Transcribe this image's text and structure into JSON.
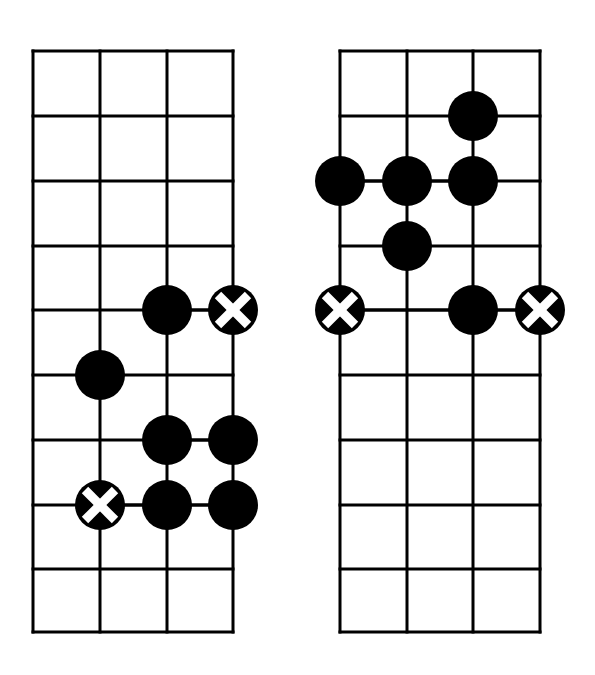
{
  "page": {
    "background_color": "#ffffff",
    "ink_color": "#000000",
    "marker_cross_color": "#ffffff",
    "width": 595,
    "height": 675
  },
  "style": {
    "grid_line_width": 3,
    "grid_outer_line_width": 3,
    "marker_radius": 25,
    "cross_arm_width": 9,
    "cross_arm_extent": 15
  },
  "diagrams": [
    {
      "id": "left-diagram",
      "name": "left-grid-diagram",
      "geometry": {
        "x_left": 33,
        "x_right": 233,
        "y_top": 51,
        "y_bottom": 632,
        "columns": 3,
        "rows": 9,
        "vertical_line_x": [
          33,
          100,
          167,
          233
        ],
        "horizontal_line_y": [
          51,
          116,
          181,
          246,
          310,
          375,
          440,
          505,
          569,
          632
        ]
      },
      "markers": [
        {
          "name": "marker-filled",
          "type": "filled",
          "x": 167,
          "y": 310,
          "string_index": 2,
          "fret_line_index": 4
        },
        {
          "name": "marker-cross",
          "type": "cross",
          "x": 233,
          "y": 310,
          "string_index": 3,
          "fret_line_index": 4
        },
        {
          "name": "marker-filled",
          "type": "filled",
          "x": 100,
          "y": 375,
          "string_index": 1,
          "fret_line_index": 5
        },
        {
          "name": "marker-filled",
          "type": "filled",
          "x": 167,
          "y": 440,
          "string_index": 2,
          "fret_line_index": 6
        },
        {
          "name": "marker-filled",
          "type": "filled",
          "x": 233,
          "y": 440,
          "string_index": 3,
          "fret_line_index": 6
        },
        {
          "name": "marker-cross",
          "type": "cross",
          "x": 100,
          "y": 505,
          "string_index": 1,
          "fret_line_index": 7
        },
        {
          "name": "marker-filled",
          "type": "filled",
          "x": 167,
          "y": 505,
          "string_index": 2,
          "fret_line_index": 7
        },
        {
          "name": "marker-filled",
          "type": "filled",
          "x": 233,
          "y": 505,
          "string_index": 3,
          "fret_line_index": 7
        }
      ],
      "connectors": [
        {
          "name": "connector-segment",
          "x1": 167,
          "y1": 310,
          "x2": 233,
          "y2": 310
        },
        {
          "name": "connector-segment",
          "x1": 167,
          "y1": 440,
          "x2": 233,
          "y2": 440
        },
        {
          "name": "connector-segment",
          "x1": 100,
          "y1": 505,
          "x2": 233,
          "y2": 505
        }
      ]
    },
    {
      "id": "right-diagram",
      "name": "right-grid-diagram",
      "geometry": {
        "x_left": 340,
        "x_right": 540,
        "y_top": 51,
        "y_bottom": 632,
        "columns": 3,
        "rows": 9,
        "vertical_line_x": [
          340,
          407,
          473,
          540
        ],
        "horizontal_line_y": [
          51,
          116,
          181,
          246,
          310,
          375,
          440,
          505,
          569,
          632
        ]
      },
      "markers": [
        {
          "name": "marker-filled",
          "type": "filled",
          "x": 473,
          "y": 116,
          "string_index": 2,
          "fret_line_index": 1
        },
        {
          "name": "marker-filled",
          "type": "filled",
          "x": 340,
          "y": 181,
          "string_index": 0,
          "fret_line_index": 2
        },
        {
          "name": "marker-filled",
          "type": "filled",
          "x": 407,
          "y": 181,
          "string_index": 1,
          "fret_line_index": 2
        },
        {
          "name": "marker-filled",
          "type": "filled",
          "x": 473,
          "y": 181,
          "string_index": 2,
          "fret_line_index": 2
        },
        {
          "name": "marker-filled",
          "type": "filled",
          "x": 407,
          "y": 246,
          "string_index": 1,
          "fret_line_index": 3
        },
        {
          "name": "marker-cross",
          "type": "cross",
          "x": 340,
          "y": 310,
          "string_index": 0,
          "fret_line_index": 4
        },
        {
          "name": "marker-filled",
          "type": "filled",
          "x": 473,
          "y": 310,
          "string_index": 2,
          "fret_line_index": 4
        },
        {
          "name": "marker-cross",
          "type": "cross",
          "x": 540,
          "y": 310,
          "string_index": 3,
          "fret_line_index": 4
        }
      ],
      "connectors": [
        {
          "name": "connector-segment",
          "x1": 340,
          "y1": 181,
          "x2": 473,
          "y2": 181
        },
        {
          "name": "connector-segment",
          "x1": 340,
          "y1": 310,
          "x2": 540,
          "y2": 310
        }
      ]
    }
  ]
}
